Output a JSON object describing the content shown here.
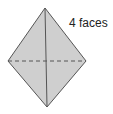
{
  "figure": {
    "label": "4 faces",
    "shape": "tetrahedron",
    "fill_color": "#cfcfcf",
    "stroke_color": "#555555"
  }
}
